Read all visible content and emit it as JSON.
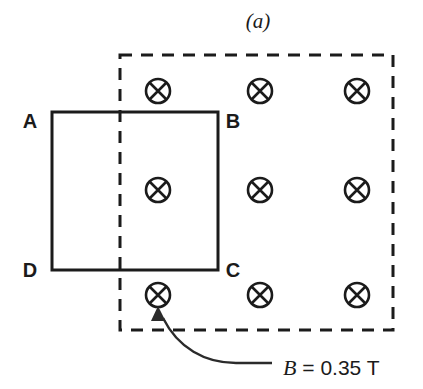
{
  "figure": {
    "caption": "(a)",
    "caption_x": 258,
    "caption_y": 28
  },
  "loop": {
    "name": "conducting-loop",
    "x": 52,
    "y": 112,
    "width": 166,
    "height": 158,
    "vertices": [
      {
        "label": "A",
        "corner": "top-left",
        "x": 30,
        "y": 128
      },
      {
        "label": "B",
        "corner": "top-right",
        "x": 225,
        "y": 128
      },
      {
        "label": "D",
        "corner": "bottom-left",
        "x": 30,
        "y": 277
      },
      {
        "label": "C",
        "corner": "bottom-right",
        "x": 225,
        "y": 277
      }
    ]
  },
  "field_region": {
    "name": "magnetic-field-region",
    "x": 120,
    "y": 55,
    "width": 273,
    "height": 275,
    "direction": "into-page",
    "symbol": "circle-cross"
  },
  "field_symbols": {
    "radius": 12,
    "columns": [
      158,
      260,
      357
    ],
    "rows": [
      91,
      190,
      295
    ]
  },
  "annotation": {
    "symbol": "B",
    "equals": " = ",
    "value": "0.35 T",
    "full_text": "B = 0.35 T",
    "text_x": 283,
    "text_y": 375,
    "leader_target_x": 158,
    "leader_target_y": 309
  },
  "colors": {
    "ink": "#1b1b1b",
    "leader": "#2b2b2b",
    "background": "#ffffff"
  }
}
